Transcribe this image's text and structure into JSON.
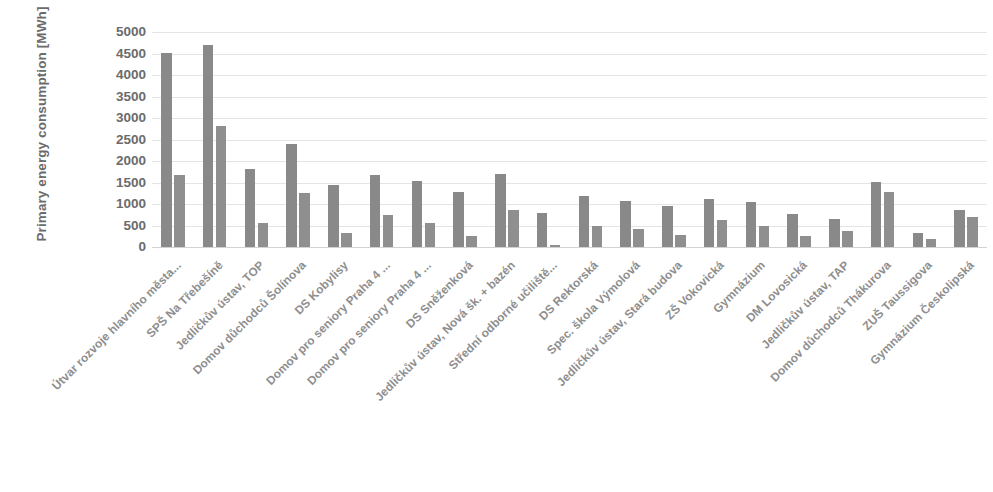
{
  "chart_data": {
    "type": "bar",
    "title": "",
    "xlabel": "",
    "ylabel": "Primary energy consumption [MWh]",
    "ylim": [
      0,
      5000
    ],
    "ytick_step": 500,
    "yticks": [
      5000,
      4500,
      4000,
      3500,
      3000,
      2500,
      2000,
      1500,
      1000,
      500,
      0
    ],
    "grid": true,
    "legend": "none",
    "bar_colors": [
      "#898989",
      "#8f8f8f"
    ],
    "categories": [
      "Útvar rozvoje hlavního města...",
      "SPŠ Na Třebešíně",
      "Jedličkův ústav, TOP",
      "Domov důchodců Šolínova",
      "DS Kobylisy",
      "Domov pro seniory Praha 4 ...",
      "Domov pro seniory Praha 4 ...",
      "DS Sněženková",
      "Jedličkův ústav, Nová šk. + bazén",
      "Střední odborné učiliště...",
      "DS Rektorská",
      "Spec. škola Výmolová",
      "Jedličkův ústav, Stará budova",
      "ZŠ Vokovická",
      "Gymnázium",
      "DM Lovosická",
      "Jedličkův ústav, TAP",
      "Domov důchodců Thákurova",
      "ZUŠ Taussigova",
      "Gymnázium Českolipská"
    ],
    "series": [
      {
        "name": "series-1",
        "values": [
          4520,
          4700,
          1820,
          2400,
          1450,
          1680,
          1540,
          1270,
          1700,
          800,
          1180,
          1080,
          950,
          1120,
          1040,
          760,
          650,
          1520,
          330,
          870
        ]
      },
      {
        "name": "series-2",
        "values": [
          1680,
          2820,
          560,
          1250,
          330,
          750,
          570,
          250,
          850,
          50,
          500,
          430,
          270,
          620,
          480,
          250,
          380,
          1290,
          180,
          700
        ]
      }
    ]
  }
}
